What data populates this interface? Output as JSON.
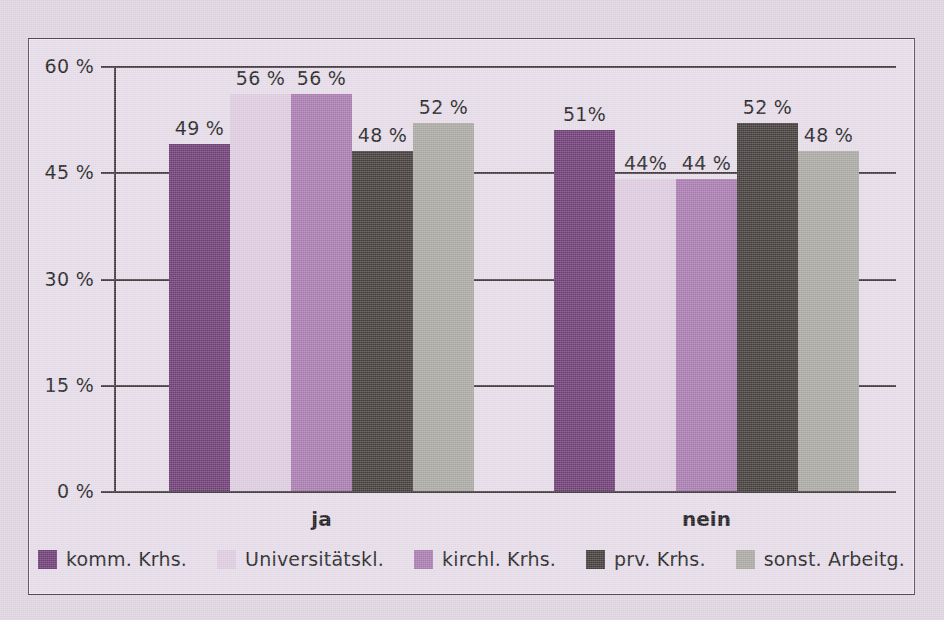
{
  "chart_data": {
    "type": "bar",
    "title": "",
    "subtitle": "",
    "xlabel": "",
    "ylabel": "",
    "categories": [
      "ja",
      "nein"
    ],
    "series": [
      {
        "name": "komm. Krhs.",
        "color": "#6d3c74",
        "values": [
          49,
          51
        ],
        "labels": [
          "49 %",
          "51%"
        ]
      },
      {
        "name": "Universitätskl.",
        "color": "#ddcbdf",
        "values": [
          56,
          44
        ],
        "labels": [
          "56 %",
          "44%"
        ]
      },
      {
        "name": "kirchl. Krhs.",
        "color": "#a87bae",
        "values": [
          56,
          44
        ],
        "labels": [
          "56 %",
          "44 %"
        ]
      },
      {
        "name": "prv. Krhs.",
        "color": "#433c39",
        "values": [
          48,
          52
        ],
        "labels": [
          "48 %",
          "52 %"
        ]
      },
      {
        "name": "sonst. Arbeitg.",
        "color": "#a9a8a2",
        "values": [
          52,
          48
        ],
        "labels": [
          "52 %",
          "48 %"
        ]
      }
    ],
    "yticks": [
      0,
      15,
      30,
      45,
      60
    ],
    "ytick_labels": [
      "0 %",
      "15 %",
      "30 %",
      "45 %",
      "60 %"
    ],
    "ylim": [
      0,
      60
    ],
    "grid": true,
    "legend_position": "bottom",
    "value_labels_shown": true
  },
  "colors": {
    "background": "#ded3e0",
    "plot_background": "#e6dce8",
    "axis": "#42393f",
    "text": "#231f24",
    "frame_border": "#4a4248"
  }
}
